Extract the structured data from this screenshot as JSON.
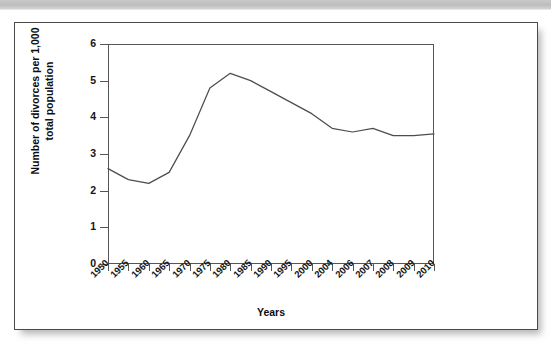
{
  "figure": {
    "background_color": "#ffffff",
    "frame_border_color": "#4a4a4a",
    "top_band_color": "#c4c4c4",
    "line_color": "#4d4d4d"
  },
  "chart_data": {
    "type": "line",
    "title": "",
    "xlabel": "Years",
    "ylabel": "Number of divorces per 1,000 total population",
    "ylabel_line1": "Number of divorces per 1,000",
    "ylabel_line2": "total population",
    "categories": [
      "1950",
      "1955",
      "1960",
      "1965",
      "1970",
      "1975",
      "1980",
      "1985",
      "1990",
      "1995",
      "2000",
      "2004",
      "2006",
      "2007",
      "2008",
      "2009",
      "2010"
    ],
    "values": [
      2.6,
      2.3,
      2.2,
      2.5,
      3.5,
      4.8,
      5.2,
      5.0,
      4.7,
      4.4,
      4.1,
      3.7,
      3.6,
      3.7,
      3.5,
      3.5,
      3.55
    ],
    "ylim": [
      0,
      6
    ],
    "yticks": [
      0,
      1,
      2,
      3,
      4,
      5,
      6
    ],
    "ytick_labels": [
      "0",
      "1",
      "2",
      "3",
      "4",
      "5",
      "6"
    ],
    "grid": false,
    "legend": null,
    "legend_position": "none",
    "series": [
      {
        "name": "Divorce rate",
        "values": [
          2.6,
          2.3,
          2.2,
          2.5,
          3.5,
          4.8,
          5.2,
          5.0,
          4.7,
          4.4,
          4.1,
          3.7,
          3.6,
          3.7,
          3.5,
          3.5,
          3.55
        ]
      }
    ]
  }
}
